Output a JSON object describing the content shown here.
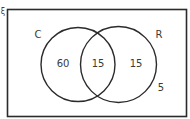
{
  "diagram": {
    "type": "venn",
    "universal_symbol": "ξ",
    "sets": [
      {
        "name": "C",
        "only": "60"
      },
      {
        "name": "R",
        "only": "15"
      }
    ],
    "intersection": "15",
    "outside": "5"
  },
  "colors": {
    "stroke": "#2b2b2b",
    "text": "#3a3a3a",
    "background": "#ffffff"
  }
}
